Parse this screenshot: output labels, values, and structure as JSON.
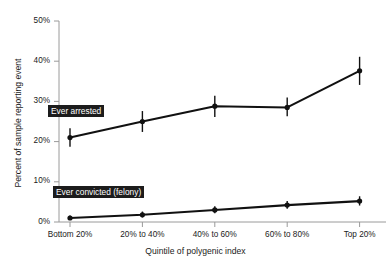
{
  "chart_data": {
    "type": "line",
    "title": "",
    "xlabel": "Quintile of polygenic index",
    "ylabel": "Percent of sample reporting event",
    "categories": [
      "Bottom 20%",
      "20% to 40%",
      "40% to 60%",
      "60% to 80%",
      "Top 20%"
    ],
    "ylim": [
      0,
      50
    ],
    "yticks": [
      0,
      10,
      20,
      30,
      40,
      50
    ],
    "ytick_labels": [
      "0%",
      "10%",
      "20%",
      "30%",
      "40%",
      "50%"
    ],
    "grid": false,
    "legend_position": "inline-labels",
    "series": [
      {
        "name": "Ever arrested",
        "values": [
          21.0,
          25.0,
          28.8,
          28.5,
          37.6
        ],
        "err_low": [
          18.7,
          22.4,
          26.1,
          26.3,
          34.1
        ],
        "err_high": [
          23.3,
          27.6,
          31.4,
          31.0,
          41.1
        ],
        "color": "#111111"
      },
      {
        "name": "Ever convicted (felony)",
        "values": [
          1.0,
          1.8,
          3.0,
          4.2,
          5.2
        ],
        "err_low": [
          0.5,
          1.1,
          2.2,
          3.3,
          4.1
        ],
        "err_high": [
          1.6,
          2.6,
          3.9,
          5.2,
          6.4
        ],
        "color": "#111111"
      }
    ]
  },
  "axes": {
    "y_title": "Percent of sample reporting event",
    "x_title": "Quintile of polygenic index",
    "y_tick_0": "0%",
    "y_tick_10": "10%",
    "y_tick_20": "20%",
    "y_tick_30": "30%",
    "y_tick_40": "40%",
    "y_tick_50": "50%",
    "x_tick_0": "Bottom 20%",
    "x_tick_1": "20% to 40%",
    "x_tick_2": "40% to 60%",
    "x_tick_3": "60% to 80%",
    "x_tick_4": "Top 20%"
  },
  "labels": {
    "arrested": "Ever arrested",
    "convicted": "Ever convicted (felony)"
  },
  "colors": {
    "line": "#111111",
    "axis": "#9a9a9a",
    "label_bg": "#1c1c1c",
    "label_fg": "#ffffff",
    "text": "#1a1a1a"
  }
}
